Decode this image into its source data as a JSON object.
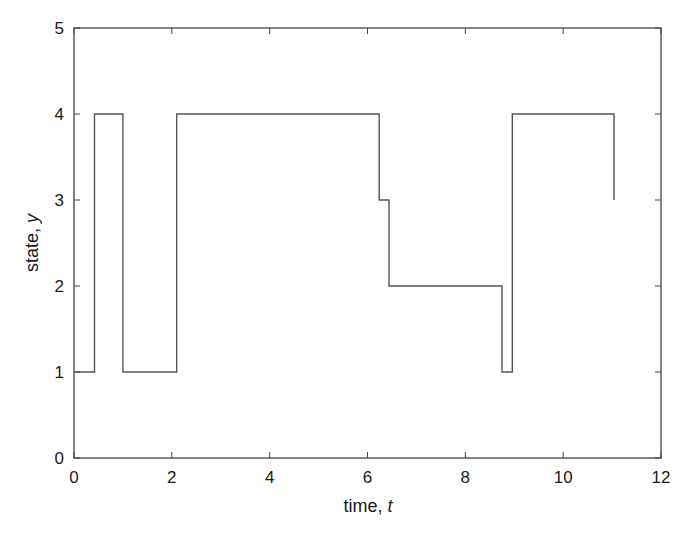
{
  "chart_data": {
    "type": "line",
    "style": "step",
    "title": "",
    "xlabel": "time, ",
    "xlabel_var": "t",
    "ylabel": "state, ",
    "ylabel_var": "y",
    "xlim": [
      0,
      12
    ],
    "ylim": [
      0,
      5
    ],
    "xticks": [
      0,
      2,
      4,
      6,
      8,
      10,
      12
    ],
    "yticks": [
      0,
      1,
      2,
      3,
      4,
      5
    ],
    "xtick_labels": [
      "0",
      "2",
      "4",
      "6",
      "8",
      "10",
      "12"
    ],
    "ytick_labels": [
      "0",
      "1",
      "2",
      "3",
      "4",
      "5"
    ],
    "grid": false,
    "legend": null,
    "line_color": "#555555",
    "series": [
      {
        "name": "state",
        "x": [
          0,
          0.42,
          0.42,
          1.0,
          1.0,
          2.1,
          2.1,
          6.24,
          6.24,
          6.44,
          6.44,
          8.75,
          8.75,
          8.96,
          8.96,
          11.04,
          11.04
        ],
        "y": [
          1,
          1,
          4,
          4,
          1,
          1,
          4,
          4,
          3,
          3,
          2,
          2,
          1,
          1,
          4,
          4,
          3
        ]
      }
    ]
  }
}
